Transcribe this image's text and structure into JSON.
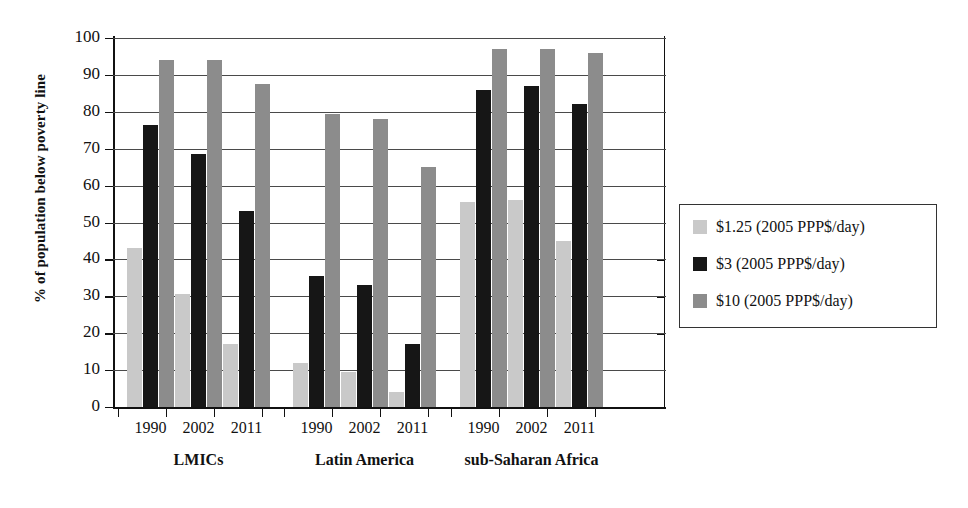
{
  "chart_data": {
    "type": "bar",
    "title": "",
    "subtitle": "",
    "xlabel": "",
    "ylabel": "% of population below poverty line",
    "ylim": [
      0,
      100
    ],
    "yticks": [
      0,
      10,
      20,
      30,
      40,
      50,
      60,
      70,
      80,
      90,
      100
    ],
    "grid": true,
    "legend_position": "right",
    "groups": [
      {
        "label": "LMICs",
        "categories": [
          "1990",
          "2002",
          "2011"
        ]
      },
      {
        "label": "Latin America",
        "categories": [
          "1990",
          "2002",
          "2011"
        ]
      },
      {
        "label": "sub-Saharan Africa",
        "categories": [
          "1990",
          "2002",
          "2011"
        ]
      }
    ],
    "categories": [
      "1990",
      "2002",
      "2011"
    ],
    "series": [
      {
        "name": "$1.25 (2005 PPP$/day)",
        "color": "#c9c9c9",
        "values_by_group": {
          "LMICs": [
            43,
            30.5,
            17
          ],
          "Latin America": [
            12,
            9.5,
            4
          ],
          "sub-Saharan Africa": [
            55.5,
            56,
            45
          ]
        }
      },
      {
        "name": "$3 (2005 PPP$/day)",
        "color": "#161616",
        "values_by_group": {
          "LMICs": [
            76.5,
            68.5,
            53
          ],
          "Latin America": [
            35.5,
            33,
            17
          ],
          "sub-Saharan Africa": [
            86,
            87,
            82
          ]
        }
      },
      {
        "name": "$10 (2005 PPP$/day)",
        "color": "#8c8c8c",
        "values_by_group": {
          "LMICs": [
            94,
            94,
            87.5
          ],
          "Latin America": [
            79.5,
            78,
            65
          ],
          "sub-Saharan Africa": [
            97,
            97,
            96
          ]
        }
      }
    ]
  },
  "axis": {
    "y_title": "% of population below poverty line",
    "y_tick_labels": [
      "100",
      "90",
      "80",
      "70",
      "60",
      "50",
      "40",
      "30",
      "20",
      "10",
      "0"
    ]
  },
  "legend": {
    "items": [
      {
        "label": "$1.25 (2005 PPP$/day)",
        "swatch": "s125"
      },
      {
        "label": "$3 (2005 PPP$/day)",
        "swatch": "s3"
      },
      {
        "label": "$10 (2005 PPP$/day)",
        "swatch": "s10"
      }
    ]
  },
  "x_axis": {
    "groups": [
      {
        "label": "LMICs",
        "years": [
          "1990",
          "2002",
          "2011"
        ]
      },
      {
        "label": "Latin America",
        "years": [
          "1990",
          "2002",
          "2011"
        ]
      },
      {
        "label": "sub-Saharan Africa",
        "years": [
          "1990",
          "2002",
          "2011"
        ]
      }
    ]
  }
}
